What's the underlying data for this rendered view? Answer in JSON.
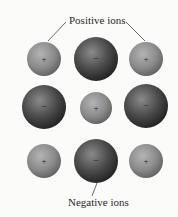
{
  "diagram": {
    "labels": {
      "positive": "Positive ions",
      "negative": "Negative ions"
    },
    "signs": {
      "positive": "+",
      "negative": "−"
    },
    "colors": {
      "background": "#fbfbfa",
      "positive_ion": "#8a8a8a",
      "negative_ion": "#4a4a4a",
      "text": "#2a2a2a"
    },
    "grid": [
      [
        "positive",
        "negative",
        "positive"
      ],
      [
        "negative",
        "positive",
        "negative"
      ],
      [
        "positive",
        "negative",
        "positive"
      ]
    ]
  }
}
